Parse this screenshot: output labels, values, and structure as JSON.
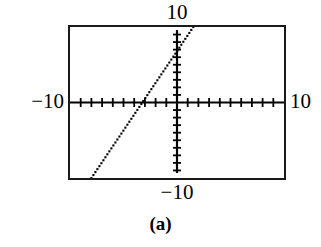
{
  "figure": {
    "caption": "(a)",
    "labels": {
      "top": "10",
      "bottom": "−10",
      "left": "−10",
      "right": "10"
    },
    "colors": {
      "frame": "#1a1a1a",
      "axis": "#000000",
      "curve": "#000000",
      "background": "#ffffff"
    }
  },
  "chart_data": {
    "type": "line",
    "title": "",
    "subtitle": "",
    "xlabel": "",
    "ylabel": "",
    "xlim": [
      -10,
      10
    ],
    "ylim": [
      -10,
      10
    ],
    "xtick_step": 1,
    "ytick_step": 1,
    "grid": false,
    "legend": false,
    "legend_position": "none",
    "style": "graphing-calculator-viewing-window",
    "annotations": [
      {
        "text": "10",
        "position": "above-window",
        "meaning": "Ymax = 10"
      },
      {
        "text": "−10",
        "position": "below-window",
        "meaning": "Ymin = −10"
      },
      {
        "text": "−10",
        "position": "left-of-window",
        "meaning": "Xmin = −10"
      },
      {
        "text": "10",
        "position": "right-of-window",
        "meaning": "Xmax = 10"
      },
      {
        "text": "(a)",
        "position": "caption-below-figure",
        "meaning": "part label"
      }
    ],
    "series": [
      {
        "name": "line",
        "rendering": "dotted-pixel-trace",
        "slope": 2.1,
        "intercept": 6.8,
        "x_intercept": -3.24,
        "y_intercept": 6.8,
        "x": [
          -7.6,
          -6.6,
          -5.6,
          -4.6,
          -3.6,
          -3.24,
          -2.6,
          -1.6,
          -0.6,
          0,
          0.4,
          1.4,
          1.8
        ],
        "values": [
          -9.2,
          -7.1,
          -5.0,
          -2.9,
          -0.8,
          0,
          1.3,
          3.4,
          5.5,
          6.8,
          7.6,
          9.7,
          10.0
        ]
      }
    ]
  }
}
